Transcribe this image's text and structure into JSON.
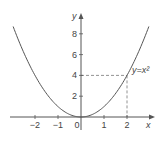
{
  "chart_data": {
    "type": "line",
    "title": "",
    "function": "y = x^2",
    "curve_label": "y=x²",
    "xlabel": "x",
    "ylabel": "y",
    "xlim": [
      -3,
      3
    ],
    "ylim": [
      0,
      9
    ],
    "x_ticks": [
      -2,
      -1,
      0,
      1,
      2
    ],
    "x_tick_labels": [
      "−2",
      "−1",
      "0",
      "1",
      "2"
    ],
    "y_ticks": [
      2,
      4,
      6,
      8
    ],
    "y_tick_labels": [
      "2",
      "4",
      "6",
      "8"
    ],
    "grid": false,
    "legend": null,
    "series": [
      {
        "name": "y=x²",
        "x": [
          -2.9,
          -2.5,
          -2,
          -1.5,
          -1,
          -0.5,
          0,
          0.5,
          1,
          1.5,
          2,
          2.5,
          2.9
        ],
        "y": [
          8.41,
          6.25,
          4,
          2.25,
          1,
          0.25,
          0,
          0.25,
          1,
          2.25,
          4,
          6.25,
          8.41
        ]
      }
    ],
    "annotations": [
      {
        "type": "dashed-guide",
        "point": [
          2,
          4
        ],
        "description": "dashed lines from (2,4) to x-axis and y-axis"
      }
    ],
    "colors": {
      "curve": "#555555",
      "axes": "#555555",
      "guide": "#777777",
      "text": "#444444"
    }
  }
}
